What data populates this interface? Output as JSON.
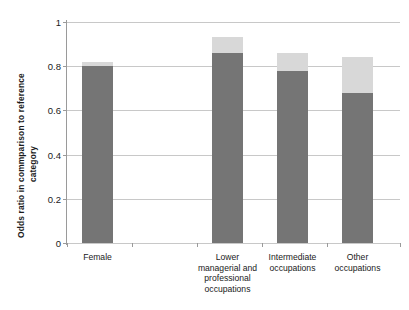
{
  "chart_data": {
    "type": "bar",
    "title": "",
    "subtitle": "",
    "xlabel": "",
    "ylabel": "Odds ratio in commparison to reference category",
    "ylabel_lines": [
      "Odds ratio in  commparison  to  reference",
      "category"
    ],
    "categories": [
      "Female",
      "Lower managerial and professional occupations",
      "Intermediate occupations",
      "Other occupations"
    ],
    "category_lines": [
      [
        "Female"
      ],
      [
        "Lower",
        "managerial and",
        "professional",
        "occupations"
      ],
      [
        "Intermediate",
        "occupations"
      ],
      [
        "Other",
        "occupations"
      ]
    ],
    "stacked": true,
    "series": [
      {
        "name": "lower-segment",
        "color": "#757575",
        "values": [
          0.8,
          0.86,
          0.78,
          0.68
        ]
      },
      {
        "name": "upper-segment",
        "color": "#d8d8d8",
        "values": [
          0.02,
          0.07,
          0.08,
          0.16
        ]
      }
    ],
    "totals": [
      0.82,
      0.93,
      0.86,
      0.84
    ],
    "ylim": [
      0,
      1
    ],
    "yticks": [
      0,
      0.2,
      0.4,
      0.6,
      0.8,
      1
    ],
    "ytick_labels": [
      "0",
      "0.2",
      "0.4",
      "0.6",
      "0.8",
      "1"
    ],
    "grid": true,
    "grid_axis": "y",
    "legend": false,
    "legend_position": "none",
    "bar_color_dark": "#757575",
    "bar_color_light": "#d8d8d8",
    "gridline_color": "#c8c8c8",
    "axis_color": "#9a9a9a",
    "background": "#ffffff"
  }
}
